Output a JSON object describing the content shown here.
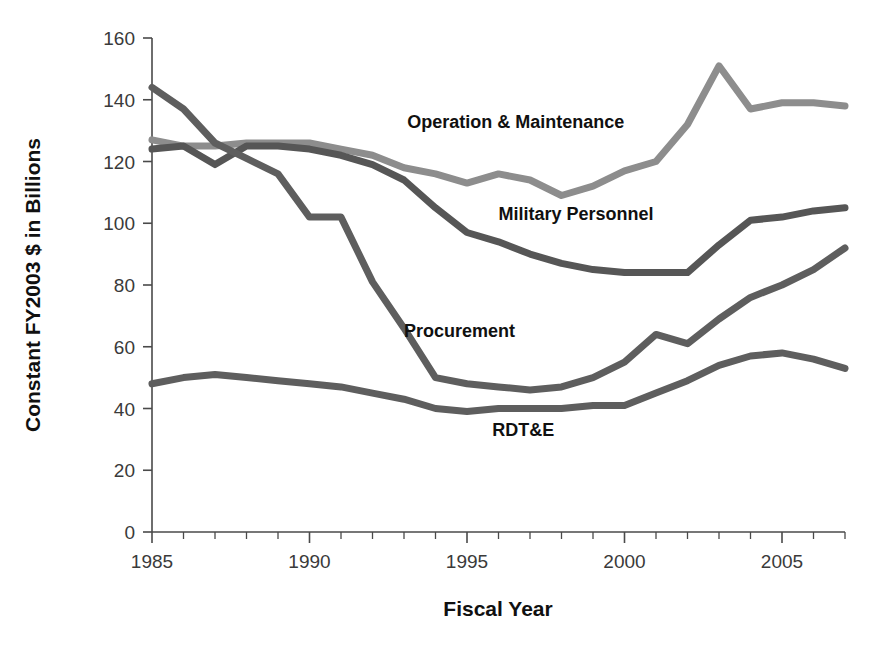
{
  "chart_data": {
    "type": "line",
    "title": "",
    "xlabel": "Fiscal Year",
    "ylabel": "Constant FY2003 $ in Billions",
    "xlim": [
      1985,
      2007
    ],
    "ylim": [
      0,
      160
    ],
    "grid": false,
    "legend_position": "inline-annotations",
    "x_tick_labels": [
      "1985",
      "1990",
      "1995",
      "2000",
      "2005"
    ],
    "x_tick_values": [
      1985,
      1990,
      1995,
      2000,
      2005
    ],
    "x_minor_step": 1,
    "y_tick_labels": [
      "0",
      "20",
      "40",
      "60",
      "80",
      "100",
      "120",
      "140",
      "160"
    ],
    "y_tick_values": [
      0,
      20,
      40,
      60,
      80,
      100,
      120,
      140,
      160
    ],
    "x": [
      1985,
      1986,
      1987,
      1988,
      1989,
      1990,
      1991,
      1992,
      1993,
      1994,
      1995,
      1996,
      1997,
      1998,
      1999,
      2000,
      2001,
      2002,
      2003,
      2004,
      2005,
      2006,
      2007
    ],
    "series": [
      {
        "name": "Operation & Maintenance",
        "color": "#8d8d8d",
        "label_x": 1993.1,
        "label_y": 131,
        "values": [
          127,
          125,
          125,
          126,
          126,
          126,
          124,
          122,
          118,
          116,
          113,
          116,
          114,
          109,
          112,
          117,
          120,
          132,
          151,
          137,
          139,
          139,
          138
        ]
      },
      {
        "name": "Military Personnel",
        "color": "#565656",
        "label_x": 1996.0,
        "label_y": 101,
        "values": [
          124,
          125,
          119,
          125,
          125,
          124,
          122,
          119,
          114,
          105,
          97,
          94,
          90,
          87,
          85,
          84,
          84,
          84,
          93,
          101,
          102,
          104,
          105
        ]
      },
      {
        "name": "Procurement",
        "color": "#5e5e5e",
        "label_x": 1993.0,
        "label_y": 63,
        "values": [
          144,
          137,
          126,
          121,
          116,
          102,
          102,
          81,
          66,
          50,
          48,
          47,
          46,
          47,
          50,
          55,
          64,
          61,
          69,
          76,
          80,
          85,
          92
        ]
      },
      {
        "name": "RDT&E",
        "color": "#5e5e5e",
        "label_x": 1995.8,
        "label_y": 31,
        "values": [
          48,
          50,
          51,
          50,
          49,
          48,
          47,
          45,
          43,
          40,
          39,
          40,
          40,
          40,
          41,
          41,
          45,
          49,
          54,
          57,
          58,
          56,
          53
        ]
      }
    ]
  }
}
